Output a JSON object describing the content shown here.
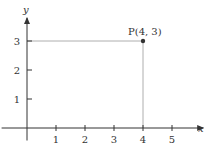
{
  "chart_data": {
    "type": "scatter",
    "title": "",
    "xlabel": "x",
    "ylabel": "y",
    "xlim": [
      -0.6,
      5.8
    ],
    "ylim": [
      -0.5,
      3.9
    ],
    "xticks": [
      1,
      2,
      3,
      4,
      5
    ],
    "yticks": [
      1,
      2,
      3
    ],
    "xtick_labels": [
      "1",
      "2",
      "3",
      "4",
      "5"
    ],
    "ytick_labels": [
      "1",
      "2",
      "3"
    ],
    "grid": false,
    "points": [
      {
        "name": "P",
        "x": 4,
        "y": 3,
        "label": "P(4, 3)"
      }
    ],
    "guide_lines": "dropped from P to both axes"
  }
}
